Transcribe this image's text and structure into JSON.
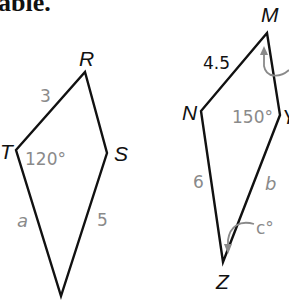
{
  "header": {
    "text": "able."
  },
  "figures": [
    {
      "name": "kite-RSTU",
      "vertices": [
        {
          "label": "R",
          "x": 85,
          "y": 72
        },
        {
          "label": "S",
          "x": 107,
          "y": 153
        },
        {
          "label": "",
          "x": 61,
          "y": 296
        },
        {
          "label": "T",
          "x": 16,
          "y": 150
        }
      ],
      "measures": {
        "side_TR": "3",
        "angle_T": "120°",
        "side_T_bottom": "a",
        "side_S_bottom": "5"
      }
    },
    {
      "name": "kite-MYZN",
      "vertices": [
        {
          "label": "M",
          "x": 267,
          "y": 33
        },
        {
          "label": "Y",
          "x": 280,
          "y": 115
        },
        {
          "label": "Z",
          "x": 223,
          "y": 262
        },
        {
          "label": "N",
          "x": 201,
          "y": 111
        }
      ],
      "measures": {
        "side_NM": "4.5",
        "angle_Y": "150°",
        "side_NZ": "6",
        "side_YZ": "b",
        "angle_Z": "c°"
      }
    }
  ],
  "colors": {
    "line": "#111111",
    "measure_text": "#8a8a8a",
    "arc": "#8a8a8a"
  }
}
